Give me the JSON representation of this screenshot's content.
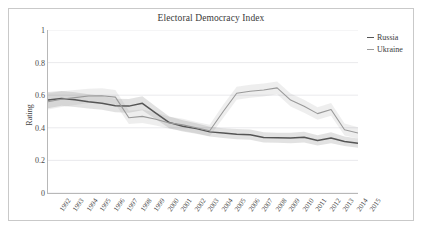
{
  "chart_data": {
    "type": "line",
    "title": "Electoral Democracy Index",
    "xlabel": "",
    "ylabel": "Rating",
    "ylim": [
      0,
      1
    ],
    "yticks": [
      0,
      0.2,
      0.4,
      0.6,
      0.8,
      1
    ],
    "ytick_labels": [
      "0",
      "0.2",
      "0.4",
      "0.6",
      "0.8",
      "1"
    ],
    "grid": true,
    "legend_position": "right-top",
    "categories": [
      "1992",
      "1993",
      "1994",
      "1995",
      "1996",
      "1997",
      "1998",
      "1999",
      "2000",
      "2001",
      "2002",
      "2003",
      "2004",
      "2005",
      "2006",
      "2007",
      "2008",
      "2009",
      "2010",
      "2011",
      "2012",
      "2013",
      "2014",
      "2015"
    ],
    "series": [
      {
        "name": "Russia",
        "color": "#555555",
        "values": [
          0.57,
          0.58,
          0.572,
          0.56,
          0.551,
          0.535,
          0.533,
          0.55,
          0.49,
          0.432,
          0.41,
          0.395,
          0.375,
          0.368,
          0.36,
          0.357,
          0.34,
          0.339,
          0.338,
          0.342,
          0.322,
          0.338,
          0.316,
          0.305
        ],
        "band_low": [
          0.52,
          0.535,
          0.528,
          0.518,
          0.51,
          0.496,
          0.492,
          0.508,
          0.452,
          0.398,
          0.378,
          0.364,
          0.346,
          0.338,
          0.33,
          0.326,
          0.31,
          0.308,
          0.306,
          0.31,
          0.292,
          0.306,
          0.288,
          0.278
        ],
        "band_high": [
          0.62,
          0.626,
          0.618,
          0.606,
          0.596,
          0.578,
          0.576,
          0.594,
          0.53,
          0.47,
          0.446,
          0.428,
          0.406,
          0.398,
          0.392,
          0.39,
          0.372,
          0.37,
          0.37,
          0.376,
          0.354,
          0.372,
          0.346,
          0.334
        ]
      },
      {
        "name": "Ukraine",
        "color": "#999999",
        "values": [
          0.56,
          0.575,
          0.585,
          0.595,
          0.597,
          0.588,
          0.462,
          0.47,
          0.452,
          0.43,
          0.418,
          0.4,
          0.382,
          0.5,
          0.612,
          0.624,
          0.632,
          0.645,
          0.57,
          0.532,
          0.487,
          0.512,
          0.388,
          0.368
        ],
        "band_low": [
          0.512,
          0.528,
          0.54,
          0.552,
          0.556,
          0.546,
          0.424,
          0.43,
          0.414,
          0.394,
          0.382,
          0.366,
          0.348,
          0.46,
          0.572,
          0.584,
          0.592,
          0.606,
          0.53,
          0.492,
          0.45,
          0.474,
          0.352,
          0.334
        ],
        "band_high": [
          0.61,
          0.624,
          0.632,
          0.64,
          0.642,
          0.632,
          0.504,
          0.512,
          0.492,
          0.468,
          0.456,
          0.436,
          0.418,
          0.542,
          0.652,
          0.664,
          0.672,
          0.684,
          0.61,
          0.572,
          0.526,
          0.552,
          0.426,
          0.404
        ]
      }
    ]
  },
  "legend": {
    "items": [
      {
        "label": "Russia",
        "color": "#555555"
      },
      {
        "label": "Ukraine",
        "color": "#9b9b9b"
      }
    ]
  }
}
